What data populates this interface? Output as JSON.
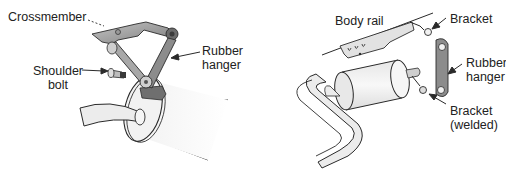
{
  "left_figure": {
    "labels": {
      "crossmember": "Crossmember",
      "shoulder_bolt_line1": "Shoulder",
      "shoulder_bolt_line2": "bolt",
      "rubber_hanger_line1": "Rubber",
      "rubber_hanger_line2": "hanger"
    }
  },
  "right_figure": {
    "labels": {
      "body_rail": "Body rail",
      "bracket": "Bracket",
      "rubber_hanger_line1": "Rubber",
      "rubber_hanger_line2": "hanger",
      "bracket_welded_line1": "Bracket",
      "bracket_welded_line2": "(welded)"
    }
  },
  "colors": {
    "line": "#2a2a2a",
    "metal_dark": "#8a8a8a",
    "metal_mid": "#b5b5b5",
    "pipe_fill": "#ececec",
    "text": "#222222"
  }
}
